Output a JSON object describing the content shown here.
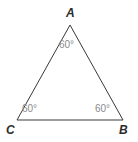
{
  "figure": {
    "type": "equilateral-triangle-diagram",
    "background_color": "#ffffff",
    "stroke_color": "#3a3a3a",
    "stroke_width": 1,
    "vertices": [
      {
        "name": "A",
        "label": "A",
        "x": 70,
        "y": 25
      },
      {
        "name": "B",
        "label": "B",
        "x": 123,
        "y": 120
      },
      {
        "name": "C",
        "label": "C",
        "x": 17,
        "y": 120
      }
    ],
    "vertex_label_color": "#2b2b2b",
    "angles": [
      {
        "at": "A",
        "label": "60°",
        "value": 60,
        "x": 59,
        "y": 40
      },
      {
        "at": "B",
        "label": "60°",
        "value": 60,
        "x": 95,
        "y": 104
      },
      {
        "at": "C",
        "label": "60°",
        "value": 60,
        "x": 22,
        "y": 104
      }
    ],
    "angle_label_color": "#8a8a8a",
    "polygon_points": "70,25 123,120 17,120"
  }
}
